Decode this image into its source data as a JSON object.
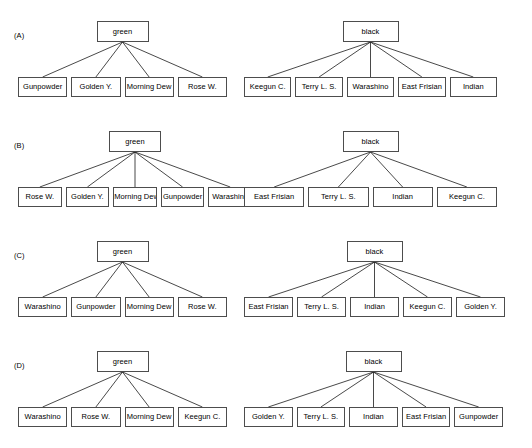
{
  "figure": {
    "type": "tree-diagram-set",
    "width": 532,
    "height": 448,
    "background": "#ffffff",
    "node_border_color": "#4d4d4d",
    "edge_color": "#1a1a1a"
  },
  "panels": [
    {
      "label": "(A)",
      "left_tree": {
        "root": "green",
        "leaves": [
          "Gunpowder",
          "Golden Y.",
          "Morning Dew",
          "Rose W."
        ]
      },
      "right_tree": {
        "root": "black",
        "leaves": [
          "Keegun C.",
          "Terry L. S.",
          "Warashino",
          "East Frisian",
          "Indian"
        ]
      }
    },
    {
      "label": "(B)",
      "left_tree": {
        "root": "green",
        "leaves": [
          "Rose W.",
          "Golden Y.",
          "Morning Dew",
          "Gunpowder",
          "Warashino"
        ]
      },
      "right_tree": {
        "root": "black",
        "leaves": [
          "East Frisian",
          "Terry L. S.",
          "Indian",
          "Keegun C."
        ]
      }
    },
    {
      "label": "(C)",
      "left_tree": {
        "root": "green",
        "leaves": [
          "Warashino",
          "Gunpowder",
          "Morning Dew",
          "Rose W."
        ]
      },
      "right_tree": {
        "root": "black",
        "leaves": [
          "East Frisian",
          "Terry L. S.",
          "Indian",
          "Keegun C.",
          "Golden Y."
        ]
      }
    },
    {
      "label": "(D)",
      "left_tree": {
        "root": "green",
        "leaves": [
          "Warashino",
          "Rose W.",
          "Morning Dew",
          "Keegun C."
        ]
      },
      "right_tree": {
        "root": "black",
        "leaves": [
          "Golden Y.",
          "Terry L. S.",
          "Indian",
          "East Frisian",
          "Gunpowder"
        ]
      }
    }
  ]
}
